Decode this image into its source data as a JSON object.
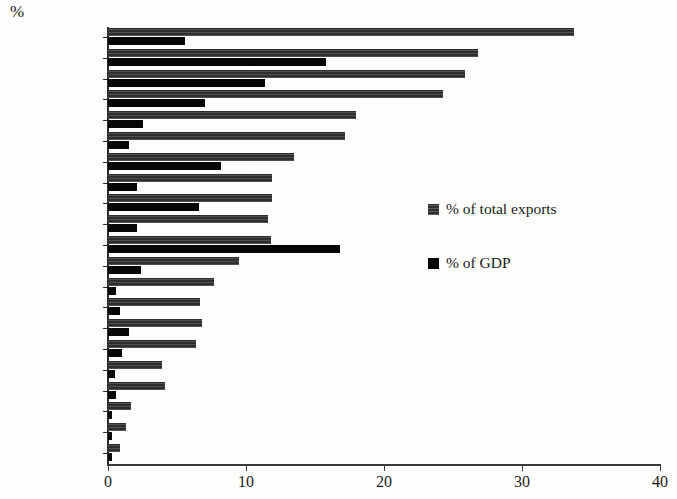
{
  "chart_data": {
    "type": "bar",
    "orientation": "horizontal",
    "title": "",
    "unit_label": "%",
    "xlabel": "",
    "ylabel": "",
    "xlim": [
      0,
      40
    ],
    "xticks": [
      0,
      10,
      20,
      30,
      40
    ],
    "xtick_labels": [
      "0",
      "10",
      "20",
      "30",
      "40"
    ],
    "grid": false,
    "legend_position": "center-right",
    "categories": [
      "Australia",
      "Taiwan",
      "Korea",
      "Chile",
      "Japan",
      "Brazil",
      "Malaysia",
      "Philippines",
      "Thailand",
      "Indonesia",
      "Singapore",
      "S.Africa",
      "US",
      "Argentina",
      "Russia",
      "Eurozone",
      "India",
      "UK",
      "Turkey",
      "Mexico",
      "Poland"
    ],
    "series": [
      {
        "name": "% of total exports",
        "color": "#2e2e2e",
        "values": [
          33.8,
          26.8,
          25.9,
          24.3,
          18.0,
          17.2,
          13.5,
          11.9,
          11.9,
          11.6,
          11.8,
          9.5,
          7.7,
          6.7,
          6.8,
          6.4,
          3.9,
          4.1,
          1.7,
          1.3,
          0.9
        ]
      },
      {
        "name": "% of GDP",
        "color": "#060606",
        "values": [
          5.6,
          15.8,
          11.4,
          7.0,
          2.5,
          1.5,
          8.2,
          2.1,
          6.6,
          2.1,
          16.8,
          2.4,
          0.6,
          0.9,
          1.5,
          1.0,
          0.5,
          0.6,
          0.3,
          0.3,
          0.3
        ]
      }
    ]
  },
  "legend": {
    "items": [
      {
        "label": "% of total exports",
        "swatch": "exports"
      },
      {
        "label": "% of GDP",
        "swatch": "gdp"
      }
    ]
  }
}
